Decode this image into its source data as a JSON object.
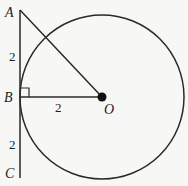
{
  "diagram": {
    "points": {
      "A": "A",
      "B": "B",
      "C": "C",
      "O": "O"
    },
    "lengths": {
      "AB": "2",
      "BO": "2",
      "BC": "2"
    },
    "elements": [
      "circle centered at O",
      "tangent line AC at B",
      "segment AO",
      "radius BO",
      "right angle mark at B"
    ],
    "colors": {
      "stroke": "#222222",
      "background": "#f7f7f5"
    }
  }
}
